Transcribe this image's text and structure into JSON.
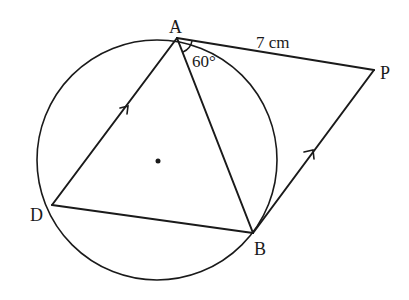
{
  "diagram": {
    "type": "circle-geometry",
    "circle": {
      "center": [
        157,
        160
      ],
      "radius": 120
    },
    "points": {
      "A": {
        "label": "A",
        "pos": [
          177,
          38
        ]
      },
      "P": {
        "label": "P",
        "pos": [
          374,
          70
        ]
      },
      "B": {
        "label": "B",
        "pos": [
          253,
          233
        ]
      },
      "D": {
        "label": "D",
        "pos": [
          52,
          205
        ]
      }
    },
    "segments": [
      "AP",
      "PB",
      "AB",
      "AD",
      "DB"
    ],
    "parallel_marks": [
      "DA",
      "BP"
    ],
    "labels": {
      "length_AP": "7 cm",
      "angle_PAB": "60°"
    },
    "stroke_color": "#1a1a1a"
  }
}
